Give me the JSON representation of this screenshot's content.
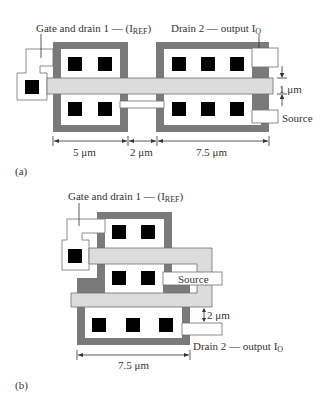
{
  "figure_a": {
    "tag": "(a)",
    "gate_label": "Gate and drain 1 — (I",
    "gate_label_sub": "REF",
    "gate_label_end": ")",
    "drain2_label": "Drain 2 — output I",
    "drain2_label_sub": "O",
    "source_label": "Source",
    "gate_width_label": "1 μm",
    "dims": [
      "5 μm",
      "2 μm",
      "7.5 μm"
    ]
  },
  "figure_b": {
    "tag": "(b)",
    "gate_label": "Gate and drain 1 — (I",
    "gate_label_sub": "REF",
    "gate_label_end": ")",
    "source_label": "Source",
    "spacing_label": "2 μm",
    "drain2_label": "Drain 2 — output I",
    "drain2_label_sub": "O",
    "dim": "7.5 μm"
  },
  "colors": {
    "diffusion_dark": "#7a7a7a",
    "polysilicon_gate": "#dcdcdc",
    "metal": "#ffffff"
  }
}
